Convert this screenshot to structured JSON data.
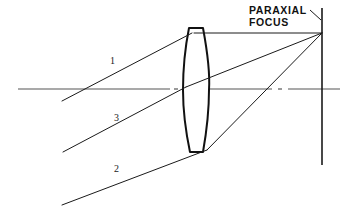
{
  "diagram": {
    "type": "optical-ray-diagram",
    "background_color": "#ffffff",
    "ink_color": "#1a1a1a",
    "axis_color": "#555555",
    "width": 350,
    "height": 219
  },
  "annotations": {
    "paraxial_focus_label": "PARAXIAL\nFOCUS",
    "paraxial_focus_line1": "PARAXIAL",
    "paraxial_focus_line2": "FOCUS"
  },
  "ray_labels": [
    {
      "id": "ray-1",
      "text": "1",
      "x": 110,
      "y": 56
    },
    {
      "id": "ray-3",
      "text": "3",
      "x": 114,
      "y": 113
    },
    {
      "id": "ray-2",
      "text": "2",
      "x": 114,
      "y": 164
    }
  ],
  "geometry": {
    "optical_axis": {
      "x1": 18,
      "y1": 89,
      "x2": 340,
      "y2": 89
    },
    "image_plane": {
      "x": 322,
      "y_top": 8,
      "y_bottom": 165
    },
    "focus_point": {
      "x": 322,
      "y": 33
    },
    "lens": {
      "center_x": 196,
      "top_y": 28,
      "bottom_y": 152,
      "left_edge_x": 183,
      "right_edge_x": 209,
      "flat_top_half_width": 7,
      "flat_bottom_half_width": 7
    },
    "rays": [
      {
        "id": "ray-1",
        "label": "1",
        "incoming": {
          "x1": 62,
          "y1": 101,
          "x2": 192,
          "y2": 33
        },
        "outgoing": {
          "x1": 192,
          "y1": 33,
          "x2": 322,
          "y2": 33
        }
      },
      {
        "id": "ray-3",
        "label": "3",
        "incoming": {
          "x1": 63,
          "y1": 152,
          "x2": 186,
          "y2": 87
        },
        "outgoing": {
          "x1": 186,
          "y1": 87,
          "x2": 322,
          "y2": 33
        }
      },
      {
        "id": "ray-2",
        "label": "2",
        "incoming": {
          "x1": 62,
          "y1": 205,
          "x2": 207,
          "y2": 150
        },
        "outgoing": {
          "x1": 207,
          "y1": 150,
          "x2": 322,
          "y2": 33
        }
      }
    ],
    "leader": {
      "x1": 312,
      "y1": 11,
      "x2": 322,
      "y2": 19
    }
  }
}
